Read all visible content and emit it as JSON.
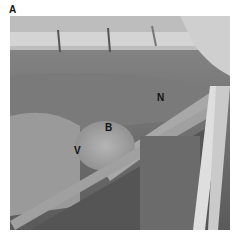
{
  "figure": {
    "panel_label": "A",
    "annotations": [
      {
        "label": "N",
        "x": 157,
        "y": 92
      },
      {
        "label": "B",
        "x": 105,
        "y": 122
      },
      {
        "label": "V",
        "x": 74,
        "y": 145
      }
    ]
  }
}
